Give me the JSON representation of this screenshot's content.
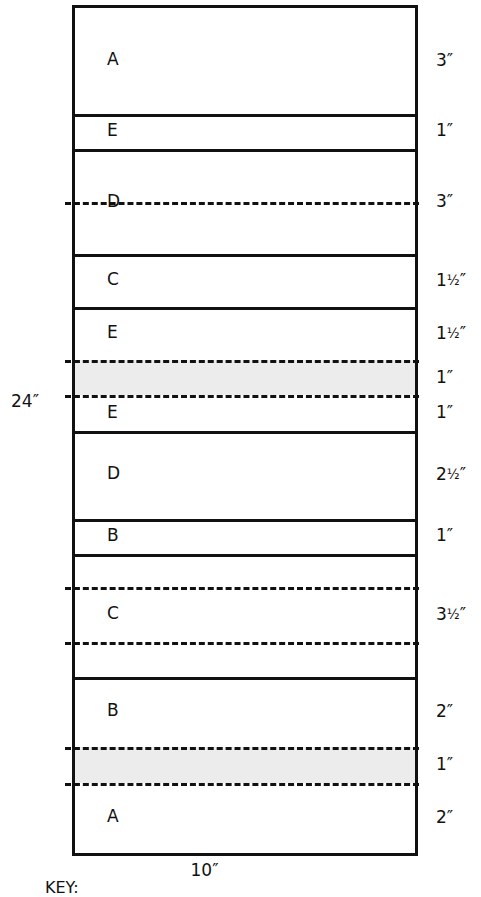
{
  "diagram": {
    "overall_height_label": "24″",
    "overall_width_label": "10″",
    "key_caption": "KEY:",
    "shaded_color": "#ececec",
    "line_color": "#111111",
    "background_color": "#ffffff",
    "scale": {
      "total_inches": 24,
      "total_pixels": 845,
      "pixels_per_inch": 35.2
    },
    "bands": [
      {
        "index": 0,
        "letter": "A",
        "dimension": "3″",
        "inches": 3,
        "shaded": false,
        "top_divider": "solid",
        "bottom_divider": "solid",
        "label_on_rule": false
      },
      {
        "index": 1,
        "letter": "E",
        "dimension": "1″",
        "inches": 1,
        "shaded": false,
        "top_divider": "solid",
        "bottom_divider": "solid",
        "label_on_rule": false
      },
      {
        "index": 2,
        "letter": "D",
        "dimension": "3″",
        "inches": 3,
        "shaded": false,
        "top_divider": "solid",
        "bottom_divider": "solid",
        "label_on_rule": true,
        "mid_rule": "dashed"
      },
      {
        "index": 3,
        "letter": "C",
        "dimension": "1½″",
        "inches": 1.5,
        "shaded": false,
        "top_divider": "solid",
        "bottom_divider": "solid",
        "label_on_rule": false
      },
      {
        "index": 4,
        "letter": "E",
        "dimension": "1½″",
        "inches": 1.5,
        "shaded": false,
        "top_divider": "solid",
        "bottom_divider": "dashed",
        "label_on_rule": false
      },
      {
        "index": 5,
        "letter": "",
        "dimension": "1″",
        "inches": 1,
        "shaded": true,
        "top_divider": "dashed",
        "bottom_divider": "dashed",
        "label_on_rule": false
      },
      {
        "index": 6,
        "letter": "E",
        "dimension": "1″",
        "inches": 1,
        "shaded": false,
        "top_divider": "dashed",
        "bottom_divider": "solid",
        "label_on_rule": false
      },
      {
        "index": 7,
        "letter": "D",
        "dimension": "2½″",
        "inches": 2.5,
        "shaded": false,
        "top_divider": "solid",
        "bottom_divider": "solid",
        "label_on_rule": false
      },
      {
        "index": 8,
        "letter": "B",
        "dimension": "1″",
        "inches": 1,
        "shaded": false,
        "top_divider": "solid",
        "bottom_divider": "solid",
        "label_on_rule": false
      },
      {
        "index": 9,
        "letter": "C",
        "dimension": "3½″",
        "inches": 3.5,
        "shaded": false,
        "top_divider": "solid",
        "bottom_divider": "solid",
        "label_on_rule": false,
        "inner_dashed_rules": 2
      },
      {
        "index": 10,
        "letter": "B",
        "dimension": "2″",
        "inches": 2,
        "shaded": false,
        "top_divider": "solid",
        "bottom_divider": "dashed",
        "label_on_rule": false
      },
      {
        "index": 11,
        "letter": "",
        "dimension": "1″",
        "inches": 1,
        "shaded": true,
        "top_divider": "dashed",
        "bottom_divider": "dashed",
        "label_on_rule": false
      },
      {
        "index": 12,
        "letter": "A",
        "dimension": "2″",
        "inches": 2,
        "shaded": false,
        "top_divider": "dashed",
        "bottom_divider": "solid",
        "label_on_rule": false
      }
    ]
  }
}
